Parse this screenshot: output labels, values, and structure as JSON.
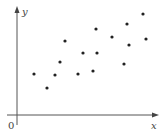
{
  "chart_data": {
    "type": "scatter",
    "title": "",
    "xlabel": "x",
    "ylabel": "y",
    "origin_label": "0",
    "grid": false,
    "legend": null,
    "axis_ticks": "none",
    "xlim": [
      0,
      140
    ],
    "ylim": [
      0,
      106
    ],
    "points": [
      {
        "x": 17,
        "y": 41
      },
      {
        "x": 30,
        "y": 27
      },
      {
        "x": 38,
        "y": 40
      },
      {
        "x": 43,
        "y": 53
      },
      {
        "x": 48,
        "y": 74
      },
      {
        "x": 61,
        "y": 41
      },
      {
        "x": 66,
        "y": 62
      },
      {
        "x": 76,
        "y": 44
      },
      {
        "x": 79,
        "y": 86
      },
      {
        "x": 80,
        "y": 62
      },
      {
        "x": 95,
        "y": 78
      },
      {
        "x": 107,
        "y": 51
      },
      {
        "x": 110,
        "y": 91
      },
      {
        "x": 112,
        "y": 70
      },
      {
        "x": 126,
        "y": 101
      },
      {
        "x": 129,
        "y": 76
      }
    ]
  },
  "style": {
    "axis_color": "#555555",
    "point_color": "#222222"
  }
}
